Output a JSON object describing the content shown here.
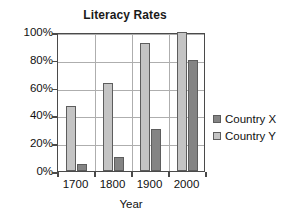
{
  "chart_data": {
    "type": "bar",
    "title": "Literacy Rates",
    "xlabel": "Year",
    "ylabel": "",
    "categories": [
      "1700",
      "1800",
      "1900",
      "2000"
    ],
    "series": [
      {
        "name": "Country X",
        "color": "#848484",
        "values": [
          5,
          10,
          30,
          80
        ]
      },
      {
        "name": "Country Y",
        "color": "#c4c4c4",
        "values": [
          47,
          63,
          92,
          100
        ]
      }
    ],
    "series_draw_order": [
      "Country Y",
      "Country X"
    ],
    "ylim": [
      0,
      100
    ],
    "ytick_labels": [
      "100%",
      "80%",
      "60%",
      "40%",
      "20%",
      "0%"
    ],
    "ytick_values": [
      100,
      80,
      60,
      40,
      20,
      0
    ],
    "grid": "horizontal-and-group-separators",
    "legend_position": "right"
  },
  "legend": {
    "entries": [
      {
        "label": "Country X"
      },
      {
        "label": "Country Y"
      }
    ]
  }
}
